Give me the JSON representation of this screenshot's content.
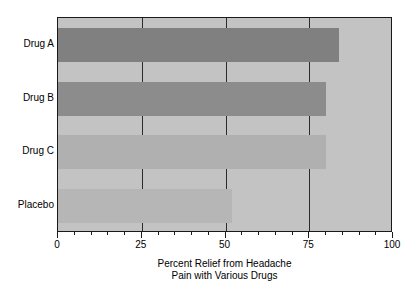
{
  "chart_data": {
    "type": "bar",
    "orientation": "horizontal",
    "title": "",
    "caption_line1": "Percent Relief from Headache",
    "caption_line2": "Pain with Various Drugs",
    "xlabel": "Percent Relief from Headache Pain with Various Drugs",
    "ylabel": "",
    "categories": [
      "Drug A",
      "Drug B",
      "Drug C",
      "Placebo"
    ],
    "values": [
      84,
      80,
      80,
      52
    ],
    "xlim": [
      0,
      100
    ],
    "xticks": [
      0,
      25,
      50,
      75,
      100
    ],
    "xticklabels": [
      "0",
      "25",
      "50",
      "75",
      "100"
    ],
    "minor_tick_interval": 5,
    "grid": true,
    "legend": false,
    "bar_colors": [
      "#808080",
      "#8c8c8c",
      "#b0b0b0",
      "#b6b6b6"
    ],
    "plot_background": "#c3c3c3",
    "frame_color": "#1a1a1a"
  },
  "bars": [
    {
      "label": "Drug A",
      "value": 84,
      "color": "#808080"
    },
    {
      "label": "Drug B",
      "value": 80,
      "color": "#8c8c8c"
    },
    {
      "label": "Drug C",
      "value": 80,
      "color": "#b0b0b0"
    },
    {
      "label": "Placebo",
      "value": 52,
      "color": "#b6b6b6"
    }
  ],
  "axis": {
    "ticks": [
      {
        "value": 0,
        "label": "0"
      },
      {
        "value": 25,
        "label": "25"
      },
      {
        "value": 50,
        "label": "50"
      },
      {
        "value": 75,
        "label": "75"
      },
      {
        "value": 100,
        "label": "100"
      }
    ]
  }
}
